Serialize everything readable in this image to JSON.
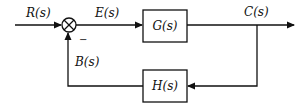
{
  "diagram": {
    "type": "negative feedback control loop",
    "signals": {
      "input": "R(s)",
      "error": "E(s)",
      "output": "C(s)",
      "feedback": "B(s)"
    },
    "blocks": {
      "forward": "G(s)",
      "feedback": "H(s)"
    },
    "summing_junction": {
      "feedback_sign": "−"
    },
    "colors": {
      "line": "#111111",
      "background": "#ffffff"
    }
  }
}
